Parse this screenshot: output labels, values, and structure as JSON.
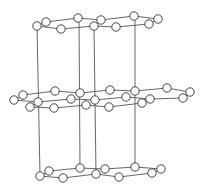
{
  "diagram": {
    "type": "layered-hexagonal-crystal-structure",
    "colors": {
      "line": "#555555",
      "atom_fill": "#ffffff",
      "atom_stroke": "#444444",
      "background": "#ffffff"
    },
    "atom_radius": 4.2,
    "layers": [
      {
        "name": "top-layer",
        "atoms": [
          [
            37,
            26
          ],
          [
            46,
            22
          ],
          [
            78,
            18
          ],
          [
            61,
            29
          ],
          [
            94,
            26
          ],
          [
            101,
            20
          ],
          [
            116,
            27
          ],
          [
            134,
            16
          ],
          [
            149,
            24
          ],
          [
            158,
            19
          ]
        ],
        "bonds": [
          [
            37,
            26,
            46,
            22
          ],
          [
            46,
            22,
            78,
            18
          ],
          [
            78,
            18,
            101,
            20
          ],
          [
            101,
            20,
            134,
            16
          ],
          [
            134,
            16,
            158,
            19
          ],
          [
            37,
            26,
            61,
            29
          ],
          [
            61,
            29,
            94,
            26
          ],
          [
            94,
            26,
            116,
            27
          ],
          [
            116,
            27,
            149,
            24
          ],
          [
            149,
            24,
            158,
            19
          ]
        ]
      },
      {
        "name": "middle-layer",
        "atoms": [
          [
            14,
            100
          ],
          [
            23,
            95
          ],
          [
            55,
            91
          ],
          [
            80,
            93
          ],
          [
            110,
            90
          ],
          [
            135,
            91
          ],
          [
            167,
            88
          ],
          [
            190,
            92
          ],
          [
            38,
            102
          ],
          [
            71,
            99
          ],
          [
            95,
            100
          ],
          [
            126,
            97
          ],
          [
            150,
            99
          ],
          [
            183,
            98
          ],
          [
            30,
            107
          ],
          [
            54,
            108
          ],
          [
            86,
            105
          ],
          [
            109,
            107
          ],
          [
            142,
            103
          ]
        ],
        "bonds": [
          [
            14,
            100,
            23,
            95
          ],
          [
            23,
            95,
            55,
            91
          ],
          [
            55,
            91,
            80,
            93
          ],
          [
            80,
            93,
            110,
            90
          ],
          [
            110,
            90,
            135,
            91
          ],
          [
            135,
            91,
            167,
            88
          ],
          [
            167,
            88,
            190,
            92
          ],
          [
            14,
            100,
            38,
            102
          ],
          [
            38,
            102,
            71,
            99
          ],
          [
            71,
            99,
            95,
            100
          ],
          [
            95,
            100,
            126,
            97
          ],
          [
            126,
            97,
            150,
            99
          ],
          [
            150,
            99,
            183,
            98
          ],
          [
            183,
            98,
            190,
            92
          ],
          [
            30,
            107,
            54,
            108
          ],
          [
            54,
            108,
            86,
            105
          ],
          [
            86,
            105,
            109,
            107
          ],
          [
            109,
            107,
            142,
            103
          ],
          [
            38,
            102,
            30,
            107
          ],
          [
            142,
            103,
            150,
            99
          ]
        ]
      },
      {
        "name": "bottom-layer",
        "atoms": [
          [
            40,
            176
          ],
          [
            49,
            171
          ],
          [
            80,
            168
          ],
          [
            63,
            178
          ],
          [
            96,
            174
          ],
          [
            105,
            169
          ],
          [
            119,
            177
          ],
          [
            135,
            167
          ],
          [
            152,
            173
          ],
          [
            161,
            169
          ]
        ],
        "bonds": [
          [
            40,
            176,
            49,
            171
          ],
          [
            49,
            171,
            80,
            168
          ],
          [
            80,
            168,
            105,
            169
          ],
          [
            105,
            169,
            135,
            167
          ],
          [
            135,
            167,
            161,
            169
          ],
          [
            40,
            176,
            63,
            178
          ],
          [
            63,
            178,
            96,
            174
          ],
          [
            96,
            174,
            119,
            177
          ],
          [
            119,
            177,
            152,
            173
          ],
          [
            152,
            173,
            161,
            169
          ]
        ]
      }
    ],
    "vertical_lines": [
      [
        37,
        26,
        40,
        176
      ],
      [
        79,
        18,
        80,
        168
      ],
      [
        94,
        26,
        96,
        174
      ],
      [
        135,
        16,
        135,
        167
      ]
    ]
  }
}
